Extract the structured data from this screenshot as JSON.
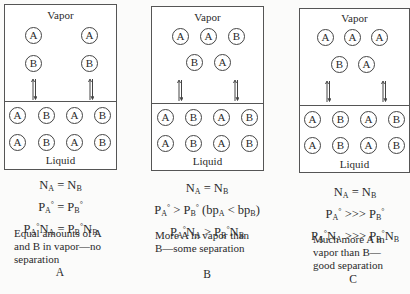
{
  "figure": {
    "labels": {
      "vapor": "Vapor",
      "liquid": "Liquid"
    },
    "panels": [
      {
        "id": "A",
        "caption": "A",
        "vapor_rows": [
          [
            "A",
            "A"
          ],
          [
            "B",
            "B"
          ]
        ],
        "liquid_rows": [
          [
            "A",
            "B",
            "A",
            "B"
          ],
          [
            "A",
            "B",
            "A",
            "B"
          ]
        ],
        "equations": [
          "N_A = N_B",
          "P_A° = P_B°",
          "P_A°N_A = P_B°N_B"
        ],
        "description": [
          "Equal amounts of A",
          "and B in vapor—no",
          "separation"
        ]
      },
      {
        "id": "B",
        "caption": "B",
        "vapor_rows": [
          [
            "A",
            "A",
            "B"
          ],
          [
            "B",
            "A"
          ]
        ],
        "liquid_rows": [
          [
            "A",
            "B",
            "A",
            "B"
          ],
          [
            "A",
            "B",
            "A",
            "B"
          ]
        ],
        "equations": [
          "N_A = N_B",
          "P_A° > P_B° (bp_A < bp_B)",
          "P_A°N_A > P_B°N_B"
        ],
        "description": [
          "More A in vapor than",
          "B—some separation"
        ]
      },
      {
        "id": "C",
        "caption": "C",
        "vapor_rows": [
          [
            "A",
            "A",
            "A"
          ],
          [
            "B",
            "A"
          ]
        ],
        "liquid_rows": [
          [
            "A",
            "B",
            "A",
            "B"
          ],
          [
            "A",
            "B",
            "A",
            "B"
          ]
        ],
        "equations": [
          "N_A = N_B",
          "P_A° >>> P_B°",
          "P_A°N_A >>> P_B°N_B"
        ],
        "description": [
          "Much more A in",
          "vapor than B—",
          "good separation"
        ]
      }
    ],
    "eq_html": {
      "A": [
        "N<sub>A</sub> = N<sub>B</sub>",
        "P<sub>A</sub><sup>°</sup> = P<sub>B</sub><sup>°</sup>",
        "P<sub>A</sub><sup>°</sup>N<sub>A</sub> = P<sub>B</sub><sup>°</sup>N<sub>B</sub>"
      ],
      "B": [
        "N<sub>A</sub> = N<sub>B</sub>",
        "P<sub>A</sub><sup>°</sup> &gt; P<sub>B</sub><sup>°</sup> (bp<sub>A</sub> &lt; bp<sub>B</sub>)",
        "P<sub>A</sub><sup>°</sup>N<sub>A</sub> &gt; P<sub>B</sub><sup>°</sup>N<sub>B</sub>"
      ],
      "C": [
        "N<sub>A</sub> = N<sub>B</sub>",
        "P<sub>A</sub><sup>°</sup> &gt;&gt;&gt; P<sub>B</sub><sup>°</sup>",
        "P<sub>A</sub><sup>°</sup>N<sub>A</sub> &gt;&gt;&gt; P<sub>B</sub><sup>°</sup>N<sub>B</sub>"
      ]
    }
  }
}
